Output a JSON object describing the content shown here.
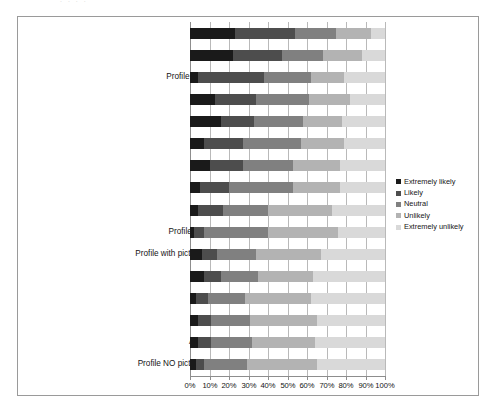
{
  "figure": {
    "ghost_header": ". .        . .",
    "frame_color": "#9a9a9a",
    "background": "#ffffff"
  },
  "legend": {
    "position": "right-middle",
    "items": [
      {
        "label": "Extremely likely",
        "color": "#1a1a1a"
      },
      {
        "label": "Likely",
        "color": "#4d4d4d"
      },
      {
        "label": "Neutral",
        "color": "#808080"
      },
      {
        "label": "Unlikely",
        "color": "#b3b3b3"
      },
      {
        "label": "Extremely unlikely",
        "color": "#d9d9d9"
      }
    ]
  },
  "axis": {
    "ticks": [
      "0%",
      "10%",
      "20%",
      "30%",
      "40%",
      "50%",
      "60%",
      "70%",
      "80%",
      "90%",
      "100%"
    ],
    "min": 0,
    "max": 100
  },
  "chart_data": {
    "type": "bar",
    "orientation": "horizontal",
    "stacked": true,
    "stacked_percent": true,
    "title": "",
    "xlabel": "",
    "ylabel": "",
    "xlim": [
      0,
      100
    ],
    "grid": true,
    "legend_position": "right",
    "series": [
      {
        "name": "Extremely likely",
        "color": "#1a1a1a",
        "values": [
          23,
          22,
          4,
          13,
          16,
          7,
          10,
          5,
          4,
          2,
          6,
          7,
          3,
          4,
          4,
          3
        ]
      },
      {
        "name": "Likely",
        "color": "#4d4d4d",
        "values": [
          31,
          25,
          34,
          21,
          17,
          20,
          17,
          15,
          13,
          5,
          8,
          9,
          6,
          7,
          7,
          4
        ]
      },
      {
        "name": "Neutral",
        "color": "#808080",
        "values": [
          21,
          21,
          24,
          27,
          25,
          30,
          26,
          33,
          23,
          33,
          20,
          19,
          19,
          20,
          21,
          22
        ]
      },
      {
        "name": "Unlikely",
        "color": "#b3b3b3",
        "values": [
          18,
          20,
          17,
          21,
          20,
          22,
          24,
          24,
          33,
          36,
          33,
          28,
          34,
          34,
          32,
          36
        ]
      },
      {
        "name": "Extremely unlikely",
        "color": "#d9d9d9",
        "values": [
          7,
          12,
          21,
          18,
          22,
          21,
          23,
          23,
          27,
          24,
          33,
          37,
          38,
          35,
          36,
          35
        ]
      }
    ],
    "categories": [
      "Facebook invitation",
      "Videoconference meeting",
      "Profile with picture in social network",
      "LinkedIn Invitation",
      "IM meeting",
      "Sign up social network",
      "Facebook group",
      "Follow twitter account",
      "Discussion forum with name",
      "Profile NO picture in social network",
      "Profile with picture in university virtual space",
      "Lessons in Youtube",
      "Write a blog",
      "Blog with class content",
      "Anonymous discussion forum",
      "Profile NO picture in university virtual space"
    ]
  }
}
